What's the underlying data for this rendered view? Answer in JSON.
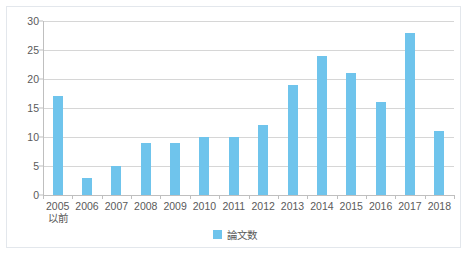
{
  "chart_data": {
    "type": "bar",
    "title": "",
    "xlabel": "",
    "ylabel": "",
    "categories": [
      "2005\n以前",
      "2006",
      "2007",
      "2008",
      "2009",
      "2010",
      "2011",
      "2012",
      "2013",
      "2014",
      "2015",
      "2016",
      "2017",
      "2018"
    ],
    "category_lines": [
      [
        "2005",
        "以前"
      ],
      [
        "2006",
        ""
      ],
      [
        "2007",
        ""
      ],
      [
        "2008",
        ""
      ],
      [
        "2009",
        ""
      ],
      [
        "2010",
        ""
      ],
      [
        "2011",
        ""
      ],
      [
        "2012",
        ""
      ],
      [
        "2013",
        ""
      ],
      [
        "2014",
        ""
      ],
      [
        "2015",
        ""
      ],
      [
        "2016",
        ""
      ],
      [
        "2017",
        ""
      ],
      [
        "2018",
        ""
      ]
    ],
    "values": [
      17,
      3,
      5,
      9,
      9,
      10,
      10,
      12,
      19,
      24,
      21,
      16,
      28,
      11
    ],
    "series": [
      {
        "name": "論文数",
        "values": [
          17,
          3,
          5,
          9,
          9,
          10,
          10,
          12,
          19,
          24,
          21,
          16,
          28,
          11
        ],
        "color": "#6fc4ec"
      }
    ],
    "ylim": [
      0,
      30
    ],
    "ytick_step": 5,
    "yticks": [
      0,
      5,
      10,
      15,
      20,
      25,
      30
    ],
    "ytick_labels": [
      "0",
      "5",
      "10",
      "15",
      "20",
      "25",
      "30"
    ],
    "grid": true,
    "grid_axis": "y",
    "legend_position": "bottom"
  },
  "legend": {
    "entries": [
      {
        "label": "論文数",
        "color": "#6fc4ec"
      }
    ]
  },
  "colors": {
    "bar": "#6fc4ec",
    "gridline": "#d6d6d6",
    "axis": "#bfbfbf",
    "text": "#5a5a5a",
    "frame": "#e3e7ec",
    "background": "#ffffff"
  }
}
